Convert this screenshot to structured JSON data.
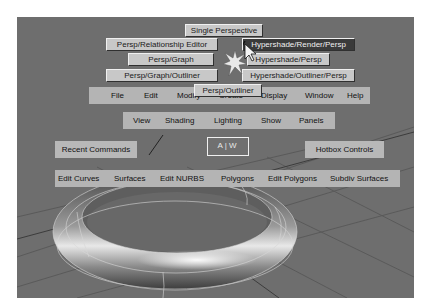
{
  "hotbox": {
    "layout_buttons": [
      {
        "label": "Single Perspective",
        "selected": false
      },
      {
        "label": "Persp/Relationship Editor",
        "selected": false
      },
      {
        "label": "Hypershade/Render/Persp",
        "selected": true
      },
      {
        "label": "Persp/Graph",
        "selected": false
      },
      {
        "label": "Hypershade/Persp",
        "selected": false
      },
      {
        "label": "Persp/Graph/Outliner",
        "selected": false
      },
      {
        "label": "Hypershade/Outliner/Persp",
        "selected": false
      },
      {
        "label": "Persp/Outliner",
        "selected": false
      }
    ],
    "main_menu": [
      "File",
      "Edit",
      "Modify",
      "Create",
      "Display",
      "Window",
      "Help"
    ],
    "panel_menu": [
      "View",
      "Shading",
      "Lighting",
      "Show",
      "Panels"
    ],
    "recent_commands": "Recent Commands",
    "center_zone": "A|W",
    "hotbox_controls": "Hotbox Controls",
    "module_menu": [
      "Edit Curves",
      "Surfaces",
      "Edit NURBS",
      "Polygons",
      "Edit Polygons",
      "Subdiv Surfaces"
    ]
  },
  "colors": {
    "viewport_bg": "#6e6e6e",
    "menu_strip": "#b4b4b4",
    "button_face": "#c8c8c8",
    "button_selected": "#3a3a3a"
  }
}
